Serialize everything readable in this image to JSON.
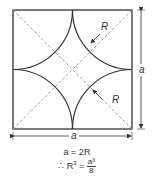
{
  "diagram": {
    "labels": {
      "radius_upper": "R",
      "radius_lower": "R",
      "side_vertical": "a",
      "side_horizontal": "a"
    },
    "equations": {
      "line1": "a = 2R",
      "line2_prefix": "∴ R",
      "line2_exp": "3",
      "line2_eq": " = ",
      "line2_num": "a³",
      "line2_den": "8"
    },
    "colors": {
      "stroke": "#333333",
      "dashed": "#888888",
      "background": "#ffffff"
    }
  }
}
